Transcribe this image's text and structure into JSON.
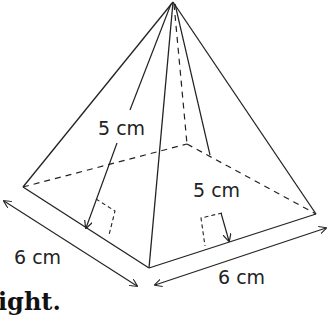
{
  "diagram": {
    "labels": {
      "slant_left": "5 cm",
      "slant_right": "5 cm",
      "base_left": "6 cm",
      "base_right": "6 cm"
    },
    "caption_fragment": "ight.",
    "colors": {
      "stroke": "#222222",
      "background": "#ffffff"
    }
  }
}
